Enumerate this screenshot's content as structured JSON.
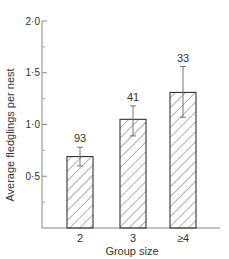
{
  "chart_data": {
    "type": "bar",
    "title": "",
    "xlabel": "Group size",
    "ylabel": "Average fledglings per nest",
    "categories": [
      "2",
      "3",
      "≥4"
    ],
    "values": [
      0.69,
      1.05,
      1.31
    ],
    "error_upper": [
      0.78,
      1.18,
      1.56
    ],
    "error_lower": [
      0.6,
      0.89,
      1.07
    ],
    "sample_sizes": [
      "93",
      "41",
      "33"
    ],
    "ylim": [
      0,
      2.0
    ],
    "yticks": [
      "0.5",
      "1.0",
      "1.5",
      "2.0"
    ],
    "ytick_labels": [
      "0·5",
      "1·0",
      "1·5",
      "2·0"
    ],
    "minor_yticks": [
      0.25,
      0.75,
      1.25,
      1.75
    ],
    "bar_fill": "hatched",
    "grid": false,
    "legend": null
  },
  "colors": {
    "axis": "#888888",
    "bar_outline": "#333333",
    "hatch": "#555555",
    "text": "#333333"
  }
}
